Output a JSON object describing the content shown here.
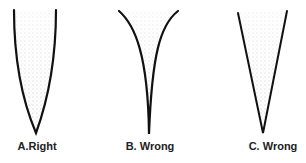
{
  "figures": [
    {
      "id": "A",
      "label": "A.Right",
      "shape": "rounded-bullet-tip"
    },
    {
      "id": "B",
      "label": "B. Wrong",
      "shape": "concave-flared-tip"
    },
    {
      "id": "C",
      "label": "C. Wrong",
      "shape": "straight-v-tip"
    }
  ],
  "colors": {
    "outline": "#111111",
    "stipple": "#555555",
    "background": "#ffffff"
  }
}
